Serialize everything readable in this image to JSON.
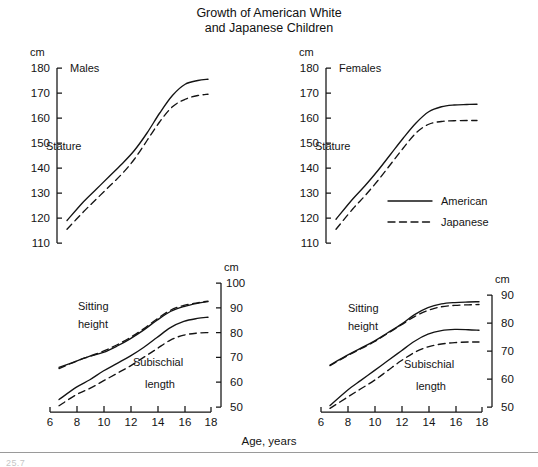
{
  "figure": {
    "title_line1": "Growth of American White",
    "title_line2": "and Japanese Children",
    "x_axis_label": "Age, years",
    "unit_label": "cm",
    "caption_partial": "25.7"
  },
  "legend": {
    "position": "inside-upper-right-panel",
    "items": [
      {
        "label": "American",
        "style": "solid"
      },
      {
        "label": "Japanese",
        "style": "dashed"
      }
    ]
  },
  "panels": {
    "males_stature": {
      "group": "Males",
      "measure": "Stature",
      "unit": "cm"
    },
    "females_stature": {
      "group": "Females",
      "measure": "Stature",
      "unit": "cm"
    },
    "males_segments": {
      "measure_upper_l1": "Sitting",
      "measure_upper_l2": "height",
      "measure_lower_l1": "Subischial",
      "measure_lower_l2": "length",
      "unit": "cm"
    },
    "females_segments": {
      "measure_upper_l1": "Sitting",
      "measure_upper_l2": "height",
      "measure_lower_l1": "Subischial",
      "measure_lower_l2": "length",
      "unit": "cm"
    }
  },
  "ticks": {
    "stature_y": [
      180,
      170,
      160,
      150,
      140,
      130,
      120,
      110
    ],
    "segments_y_left": [
      100,
      90,
      80,
      70,
      60,
      50
    ],
    "segments_y_right": [
      90,
      80,
      70,
      60,
      50
    ],
    "age_x": [
      6,
      8,
      10,
      12,
      14,
      16,
      18
    ]
  },
  "chart_data": {
    "type": "line",
    "title": "Growth of American White and Japanese Children",
    "xlabel": "Age, years",
    "ylabel": "cm",
    "grid": false,
    "legend_position": "upper-right panel, lower right",
    "panels": [
      {
        "id": "males-stature",
        "group": "Males",
        "measure": "Stature",
        "xlim": [
          6,
          18
        ],
        "ylim": [
          110,
          180
        ],
        "xticks": [
          6,
          8,
          10,
          12,
          14,
          16,
          18
        ],
        "yticks": [
          110,
          120,
          130,
          140,
          150,
          160,
          170,
          180
        ],
        "x": [
          6.7,
          8,
          9,
          10,
          11,
          12,
          13,
          14,
          15,
          16,
          17,
          17.8
        ],
        "series": [
          {
            "name": "American",
            "style": "solid",
            "values": [
              119.0,
              126.5,
              131.5,
              136.5,
              141.5,
              147.0,
              154.0,
              162.0,
              169.0,
              173.5,
              175.0,
              175.5
            ]
          },
          {
            "name": "Japanese",
            "style": "dashed",
            "values": [
              115.5,
              122.5,
              127.5,
              132.5,
              137.5,
              143.5,
              151.0,
              158.5,
              164.5,
              167.5,
              169.0,
              169.5
            ]
          }
        ]
      },
      {
        "id": "females-stature",
        "group": "Females",
        "measure": "Stature",
        "xlim": [
          6,
          18
        ],
        "ylim": [
          110,
          180
        ],
        "xticks": [
          6,
          8,
          10,
          12,
          14,
          16,
          18
        ],
        "yticks": [
          110,
          120,
          130,
          140,
          150,
          160,
          170,
          180
        ],
        "x": [
          6.7,
          8,
          9,
          10,
          11,
          12,
          13,
          14,
          15,
          16,
          17,
          17.8
        ],
        "series": [
          {
            "name": "American",
            "style": "solid",
            "values": [
              119.5,
              127.5,
              133.0,
              139.0,
              145.5,
              152.0,
              158.0,
              162.5,
              164.5,
              165.2,
              165.4,
              165.5
            ]
          },
          {
            "name": "Japanese",
            "style": "dashed",
            "values": [
              115.5,
              123.5,
              129.0,
              135.0,
              141.5,
              148.0,
              154.0,
              157.5,
              158.6,
              158.9,
              159.0,
              159.0
            ]
          }
        ]
      },
      {
        "id": "males-segments",
        "group": "Males",
        "xlim": [
          6,
          18
        ],
        "ylim": [
          50,
          100
        ],
        "xticks": [
          6,
          8,
          10,
          12,
          14,
          16,
          18
        ],
        "yticks": [
          50,
          60,
          70,
          80,
          90,
          100
        ],
        "x": [
          6.7,
          8,
          9,
          10,
          11,
          12,
          13,
          14,
          15,
          16,
          17,
          17.8
        ],
        "series": [
          {
            "name": "American sitting height",
            "measure": "Sitting height",
            "style": "solid",
            "values": [
              66.0,
              68.5,
              70.5,
              72.0,
              74.5,
              77.5,
              81.0,
              85.0,
              88.5,
              90.5,
              91.8,
              92.5
            ]
          },
          {
            "name": "Japanese sitting height",
            "measure": "Sitting height",
            "style": "dashed",
            "values": [
              65.5,
              68.5,
              70.5,
              72.5,
              75.0,
              78.0,
              81.5,
              85.5,
              89.0,
              91.0,
              92.0,
              92.7
            ]
          },
          {
            "name": "American subischial length",
            "measure": "Subischial length",
            "style": "solid",
            "values": [
              53.0,
              58.0,
              61.0,
              64.5,
              67.5,
              70.5,
              74.0,
              78.0,
              82.0,
              84.5,
              85.7,
              86.2
            ]
          },
          {
            "name": "Japanese subischial length",
            "measure": "Subischial length",
            "style": "dashed",
            "values": [
              50.5,
              55.0,
              57.5,
              60.5,
              63.5,
              66.5,
              70.0,
              73.5,
              77.0,
              79.0,
              79.8,
              80.0
            ]
          }
        ]
      },
      {
        "id": "females-segments",
        "group": "Females",
        "xlim": [
          6,
          18
        ],
        "ylim": [
          50,
          90
        ],
        "xticks": [
          6,
          8,
          10,
          12,
          14,
          16,
          18
        ],
        "yticks": [
          50,
          60,
          70,
          80,
          90
        ],
        "x": [
          6.7,
          8,
          9,
          10,
          11,
          12,
          13,
          14,
          15,
          16,
          17,
          17.8
        ],
        "series": [
          {
            "name": "American sitting height",
            "measure": "Sitting height",
            "style": "solid",
            "values": [
              65.0,
              68.5,
              71.0,
              73.5,
              76.5,
              79.5,
              83.0,
              85.5,
              86.8,
              87.3,
              87.5,
              87.6
            ]
          },
          {
            "name": "Japanese sitting height",
            "measure": "Sitting height",
            "style": "dashed",
            "values": [
              64.8,
              68.3,
              70.8,
              73.3,
              76.3,
              79.3,
              82.3,
              84.5,
              85.8,
              86.3,
              86.5,
              86.6
            ]
          },
          {
            "name": "American subischial length",
            "measure": "Subischial length",
            "style": "solid",
            "values": [
              50.5,
              56.0,
              59.5,
              63.0,
              66.5,
              70.0,
              73.5,
              76.0,
              77.3,
              77.7,
              77.6,
              77.4
            ]
          },
          {
            "name": "Japanese subischial length",
            "measure": "Subischial length",
            "style": "dashed",
            "values": [
              49.5,
              53.5,
              56.5,
              59.5,
              63.0,
              66.5,
              69.5,
              71.5,
              72.5,
              73.0,
              73.2,
              73.2
            ]
          }
        ]
      }
    ]
  }
}
